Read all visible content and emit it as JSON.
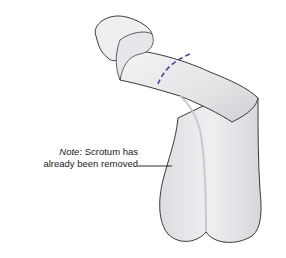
{
  "figure": {
    "incision_line": {
      "style": "dashed",
      "color": "#4a4a9c"
    },
    "colors": {
      "skin_fill": "#e9eaec",
      "outline": "#3a3a3a",
      "shadow": "#c8c9cc",
      "background": "#ffffff"
    }
  },
  "annotation": {
    "prefix": "Note:",
    "line1": "Scrotum has",
    "line2": "already been removed"
  }
}
